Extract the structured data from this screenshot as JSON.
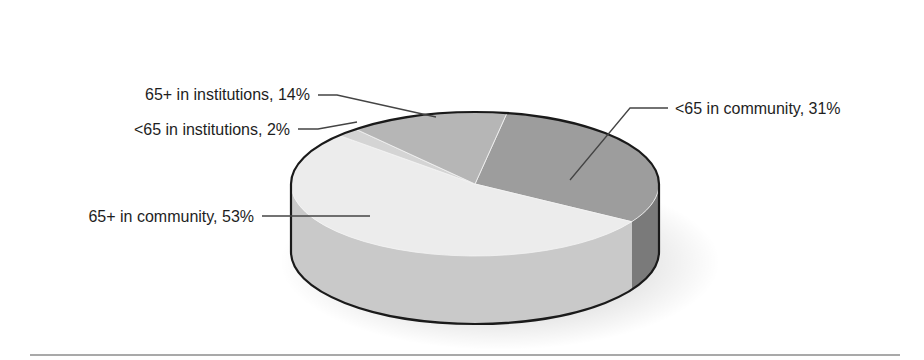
{
  "chart_data": {
    "type": "pie",
    "style": "3d",
    "title": "",
    "slices": [
      {
        "label": "<65 in community",
        "value": 31,
        "text": "<65 in community, 31%",
        "color": "#9d9d9d",
        "side_color": "#7a7a7a"
      },
      {
        "label": "65+ in community",
        "value": 53,
        "text": "65+ in community, 53%",
        "color": "#ececec",
        "side_color": "#c9c9c9"
      },
      {
        "label": "<65 in institutions",
        "value": 2,
        "text": "<65 in institutions, 2%",
        "color": "#d4d4d4",
        "side_color": "#bdbdbd"
      },
      {
        "label": "65+ in institutions",
        "value": 14,
        "text": "65+ in institutions, 14%",
        "color": "#b6b6b6",
        "side_color": "#9a9a9a"
      }
    ],
    "legend": "none",
    "label_placement": "callouts"
  }
}
